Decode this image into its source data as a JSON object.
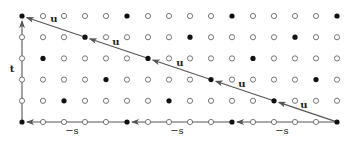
{
  "diagram": {
    "grid": {
      "columns": 16,
      "rows": 6,
      "x0": 22,
      "dx": 21,
      "y0": 16,
      "dy": 21.2,
      "filled_columns_by_row": [
        [
          0,
          5,
          10,
          15
        ],
        [
          3,
          8,
          13
        ],
        [
          1,
          6,
          11
        ],
        [
          4,
          9,
          14
        ],
        [
          2,
          7,
          12
        ],
        [
          0,
          5,
          10,
          15
        ]
      ]
    },
    "colors": {
      "filled_dot": "#111111",
      "open_dot_stroke": "#555555",
      "arrow": "#555555",
      "text": "#222222"
    },
    "vectors": {
      "u": {
        "label": "u",
        "chain": [
          [
            15,
            5
          ],
          [
            12,
            4
          ],
          [
            9,
            3
          ],
          [
            6,
            2
          ],
          [
            3,
            1
          ],
          [
            0,
            0
          ]
        ],
        "label_positions": [
          [
            304,
            108
          ],
          [
            242,
            87
          ],
          [
            180,
            66
          ],
          [
            116,
            45
          ],
          [
            54,
            22
          ]
        ]
      },
      "t": {
        "label": "t",
        "from": [
          0,
          5
        ],
        "to": [
          0,
          0
        ],
        "label_position": [
          12,
          72
        ]
      },
      "s": {
        "label": "−s",
        "chain": [
          [
            15,
            5
          ],
          [
            10,
            5
          ],
          [
            5,
            5
          ],
          [
            0,
            5
          ]
        ],
        "label_positions": [
          [
            282,
            134
          ],
          [
            177,
            134
          ],
          [
            72,
            134
          ]
        ]
      }
    }
  }
}
